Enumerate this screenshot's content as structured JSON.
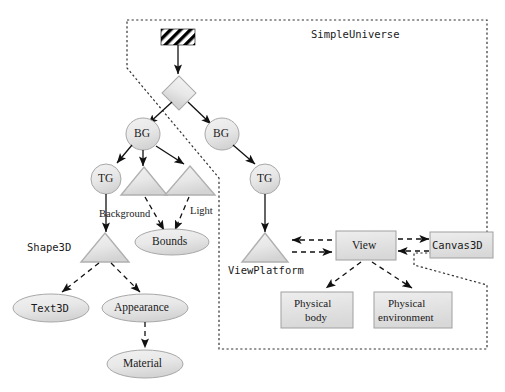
{
  "diagram": {
    "title": "SimpleUniverse",
    "boundary_label": "SimpleUniverse",
    "nodes": {
      "locale": "",
      "bg_left": "BG",
      "bg_right": "BG",
      "tg_left": "TG",
      "tg_right": "TG",
      "bounds": "Bounds",
      "shape3d": "Shape3D",
      "text3d": "Text3D",
      "appearance": "Appearance",
      "material": "Material",
      "viewplatform": "ViewPlatform",
      "view": "View",
      "canvas3d": "Canvas3D",
      "physical_body_line1": "Physical",
      "physical_body_line2": "body",
      "physical_env_line1": "Physical",
      "physical_env_line2": "environment"
    },
    "edge_labels": {
      "background": "Background",
      "light": "Light"
    },
    "colors": {
      "node_fill": "#e6e6e6",
      "node_stroke": "#9a9a9a",
      "edge": "#111111",
      "boundary": "#333333",
      "text": "#1a1a1a",
      "hatch": "#000000"
    }
  }
}
